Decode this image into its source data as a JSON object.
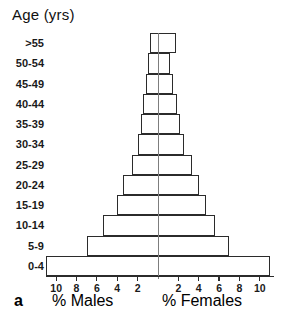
{
  "figure": {
    "panel_letter": "a",
    "y_axis_title": "Age (yrs)",
    "males_caption": "% Males",
    "females_caption": "% Females"
  },
  "chart_data": {
    "type": "bar",
    "subtype": "population-pyramid",
    "title": "",
    "xlabel": "",
    "ylabel": "Age (yrs)",
    "left_axis_label": "% Males",
    "right_axis_label": "% Females",
    "grid": false,
    "legend": null,
    "categories": [
      ">55",
      "50-54",
      "45-49",
      "40-44",
      "35-39",
      "30-34",
      "25-29",
      "20-24",
      "15-19",
      "10-14",
      "5-9",
      "0-4"
    ],
    "xlim": [
      -11,
      11
    ],
    "xticks_left": [
      10,
      8,
      6,
      4,
      2
    ],
    "xticks_right": [
      2,
      4,
      6,
      8,
      10
    ],
    "series": [
      {
        "name": "% Males",
        "side": "left",
        "values": [
          0.8,
          1.0,
          1.2,
          1.5,
          1.7,
          2.0,
          2.6,
          3.4,
          4.0,
          5.4,
          7.0,
          11.0
        ]
      },
      {
        "name": "% Females",
        "side": "right",
        "values": [
          1.8,
          1.2,
          1.5,
          1.9,
          2.2,
          2.6,
          3.3,
          4.0,
          4.7,
          5.6,
          7.0,
          11.0
        ]
      }
    ]
  },
  "style": {
    "bar_stroke": "#2b2b2b",
    "bar_fill": "#ffffff",
    "axis_color": "#7d7d7d",
    "text_color": "#1a1a1a"
  }
}
